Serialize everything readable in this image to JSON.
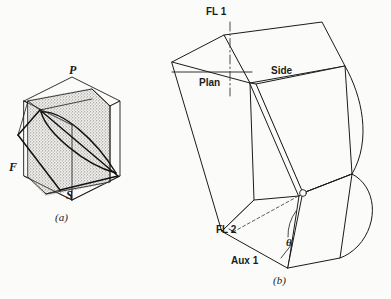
{
  "figure": {
    "background_color": "#fbfbf9",
    "ink_color": "#1b1b1b",
    "width": 391,
    "height": 299
  },
  "panel_a": {
    "caption": "(a)",
    "labels": {
      "top_plane": "P",
      "frontal_plane": "F",
      "side_plane": "S"
    },
    "description_icons": {
      "cube": "isometric-cube-icon",
      "cutting_plane": "stippled-plane-icon",
      "ellipse": "ellipse-section-icon"
    }
  },
  "panel_b": {
    "caption": "(b)",
    "labels": {
      "fold_line_1": "FL 1",
      "plan_view": "Plan",
      "side_view": "Side",
      "fold_line_2": "FL 2",
      "auxiliary_view": "Aux 1",
      "angle": "θ"
    },
    "description_icons": {
      "prism": "oblique-prism-icon",
      "fold_line": "dash-dot-line-icon",
      "angle_arc": "angle-arc-icon",
      "point_marker": "point-circle-icon",
      "curved_edge": "curved-edge-icon"
    }
  }
}
